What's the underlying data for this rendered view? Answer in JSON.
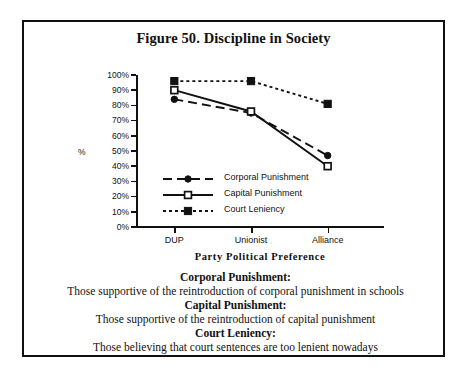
{
  "figure": {
    "title": "Figure 50. Discipline in Society"
  },
  "chart_data": {
    "type": "line",
    "title": "Figure 50. Discipline in Society",
    "xlabel": "Party Political Preference",
    "ylabel": "%",
    "categories": [
      "DUP",
      "Unionist",
      "Alliance"
    ],
    "ylim": [
      0,
      100
    ],
    "ytick_labels": [
      "100%",
      "90%",
      "80%",
      "70%",
      "60%",
      "50%",
      "40%",
      "30%",
      "20%",
      "10%",
      "0%"
    ],
    "ytick_values": [
      100,
      90,
      80,
      70,
      60,
      50,
      40,
      30,
      20,
      10,
      0
    ],
    "grid": false,
    "legend_position": "inside-lower-left",
    "series": [
      {
        "name": "Corporal Punishment",
        "values": [
          84,
          75,
          47
        ],
        "marker": "filled-circle",
        "line_style": "dashed"
      },
      {
        "name": "Capital Punishment",
        "values": [
          90,
          76,
          40
        ],
        "marker": "open-square",
        "line_style": "solid"
      },
      {
        "name": "Court Leniency",
        "values": [
          96,
          96,
          81
        ],
        "marker": "filled-square",
        "line_style": "dotted"
      }
    ]
  },
  "caption": {
    "entries": [
      {
        "term": "Corporal Punishment:",
        "description": "Those supportive of the reintroduction of corporal punishment in schools"
      },
      {
        "term": "Capital Punishment:",
        "description": "Those supportive of the reintroduction of capital punishment"
      },
      {
        "term": "Court Leniency:",
        "description": "Those believing that court sentences are too lenient nowadays"
      }
    ]
  },
  "colors": {
    "ink": "#111111",
    "background": "#ffffff"
  }
}
